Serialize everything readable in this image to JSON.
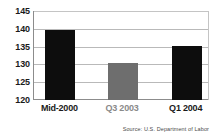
{
  "chart_data": {
    "type": "bar",
    "title": "",
    "subtitle": "",
    "xlabel": "",
    "ylabel": "",
    "categories": [
      "Mid-2000",
      "Q3 2003",
      "Q1 2004"
    ],
    "values": [
      139.6,
      130.4,
      135.2
    ],
    "ylim": [
      120,
      145
    ],
    "yticks": [
      145,
      140,
      135,
      130,
      125,
      120
    ],
    "ytick_labels": [
      "145",
      "140",
      "135",
      "130",
      "125",
      "120"
    ],
    "grid": true,
    "legend": false,
    "legend_position": "none",
    "bar_colors": [
      "#0d0d0d",
      "#6e6e6e",
      "#0d0d0d"
    ],
    "label_colors": [
      "#1a1a1a",
      "#8a8a8a",
      "#1a1a1a"
    ],
    "annotations": [
      "Source: U.S. Department of Labor"
    ]
  },
  "source": {
    "text": "Source: U.S. Department of Labor"
  },
  "colors": {
    "background": "#ffffff",
    "bar_dark": "#0d0d0d",
    "bar_gray": "#6e6e6e",
    "gridline": "#b9b9b9",
    "axis": "#8c8c8c",
    "text": "#1a1a1a",
    "muted_text": "#8a8a8a",
    "source_text": "#4a4a4a"
  }
}
